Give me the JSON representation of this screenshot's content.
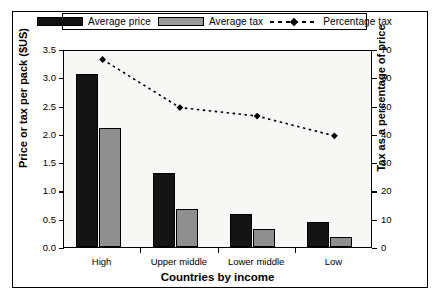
{
  "chart_data": {
    "type": "bar",
    "title": "",
    "subtitle": "",
    "xlabel": "Countries by income",
    "ylabel": "Price or tax per pack ($US)",
    "y2label": "Tax as a percentage of price",
    "categories": [
      "High",
      "Upper middle",
      "Lower middle",
      "Low"
    ],
    "ylim": [
      0,
      3.5
    ],
    "yticks": [
      "0.0",
      "0.5",
      "1.0",
      "1.5",
      "2.0",
      "2.5",
      "3.0",
      "3.5"
    ],
    "y2lim": [
      0,
      70
    ],
    "y2ticks": [
      "0",
      "10",
      "20",
      "30",
      "40",
      "50",
      "60",
      "70"
    ],
    "grid": false,
    "legend_position": "top-center",
    "series": [
      {
        "name": "Average price",
        "type": "bar",
        "axis": "left",
        "color": "#141414",
        "values": [
          3.05,
          1.3,
          0.58,
          0.45
        ]
      },
      {
        "name": "Average tax",
        "type": "bar",
        "axis": "left",
        "color": "#8f8f8f",
        "values": [
          2.1,
          0.68,
          0.32,
          0.17
        ]
      },
      {
        "name": "Percentage tax",
        "type": "line",
        "axis": "right",
        "color": "#000000",
        "marker": "diamond",
        "linestyle": "dotted",
        "values": [
          67,
          50,
          47,
          40
        ]
      }
    ]
  },
  "legend": {
    "items": [
      {
        "label": "Average price",
        "swatch": "black-bar-swatch"
      },
      {
        "label": "Average tax",
        "swatch": "gray-bar-swatch"
      },
      {
        "label": "Percentage tax",
        "swatch": "dotted-line-diamond-marker"
      }
    ]
  }
}
